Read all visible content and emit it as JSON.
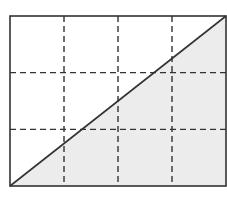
{
  "diagram": {
    "type": "grid-with-diagonal",
    "grid": {
      "columns": 4,
      "rows": 3,
      "line_style": "dashed"
    },
    "rectangle": {
      "x": 10,
      "y": 16,
      "width": 216,
      "height": 170
    },
    "diagonal": {
      "from": "bottom-left",
      "to": "top-right"
    },
    "shaded_region": "lower-right triangle",
    "colors": {
      "border": "#333333",
      "grid_line": "#333333",
      "diagonal": "#333333",
      "shade": "#ececec",
      "background": "#ffffff"
    }
  }
}
